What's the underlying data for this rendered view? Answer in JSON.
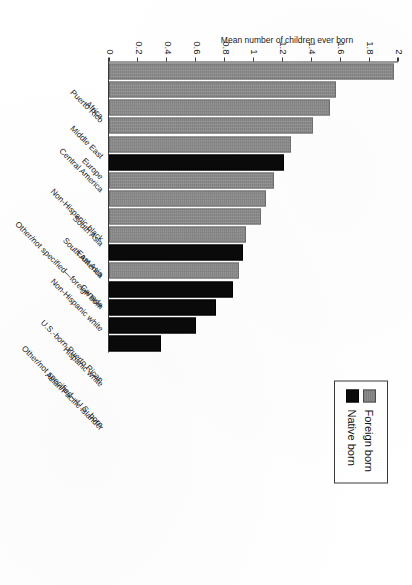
{
  "chart_data": {
    "type": "bar",
    "orientation": "horizontal",
    "title": "",
    "xlabel": "",
    "ylabel": "Mean number of children ever born",
    "ylim": [
      0,
      2
    ],
    "ytick_step": 0.2,
    "ytick_labels": [
      "0",
      "0.2",
      "0.4",
      "0.6",
      "0.8",
      "1",
      "1.2",
      "1.4",
      "1.6",
      "1.8",
      "2"
    ],
    "grid": false,
    "legend_position": "top-left",
    "legend": [
      {
        "label": "Foreign born",
        "color": "#8c8c8c"
      },
      {
        "label": "Native born",
        "color": "#0a0a0a"
      }
    ],
    "categories": [
      "Puerto Rico",
      "Africa",
      "Middle East",
      "Central America",
      "Europe",
      "Non-Hispanic black",
      "Other/not specified—foreign born",
      "South Asia",
      "South America",
      "East Asia",
      "Non-Hispanic white",
      "Canada",
      "U.S.-born Puerto Rican",
      "Other/not specified—U.S. born",
      "Hispanic white",
      "Asian/Pacific Islander"
    ],
    "points": [
      {
        "category": "Puerto Rico",
        "value": 1.97,
        "group": "Foreign born"
      },
      {
        "category": "Africa",
        "value": 1.57,
        "group": "Foreign born"
      },
      {
        "category": "Middle East",
        "value": 1.53,
        "group": "Foreign born"
      },
      {
        "category": "Central America",
        "value": 1.41,
        "group": "Foreign born"
      },
      {
        "category": "Europe",
        "value": 1.26,
        "group": "Foreign born"
      },
      {
        "category": "Non-Hispanic black",
        "value": 1.21,
        "group": "Native born"
      },
      {
        "category": "Other/not specified—foreign born",
        "value": 1.14,
        "group": "Foreign born"
      },
      {
        "category": "South Asia",
        "value": 1.09,
        "group": "Foreign born"
      },
      {
        "category": "South America",
        "value": 1.05,
        "group": "Foreign born"
      },
      {
        "category": "East Asia",
        "value": 0.95,
        "group": "Foreign born"
      },
      {
        "category": "Non-Hispanic white",
        "value": 0.93,
        "group": "Native born"
      },
      {
        "category": "Canada",
        "value": 0.9,
        "group": "Foreign born"
      },
      {
        "category": "U.S.-born Puerto Rican",
        "value": 0.86,
        "group": "Native born"
      },
      {
        "category": "Other/not specified—U.S. born",
        "value": 0.74,
        "group": "Native born"
      },
      {
        "category": "Hispanic white",
        "value": 0.6,
        "group": "Native born"
      },
      {
        "category": "Asian/Pacific Islander",
        "value": 0.36,
        "group": "Native born"
      }
    ]
  }
}
